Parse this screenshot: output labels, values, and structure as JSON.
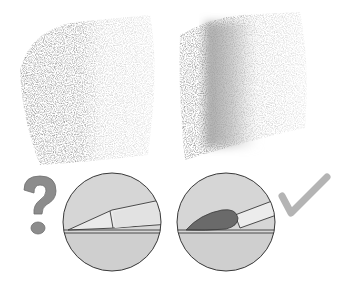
{
  "illustration": {
    "subject": "colored pencil blending comparison",
    "panels": [
      {
        "id": "left",
        "swatch": "pencil-only texture: dark grainy left half fading to light grainy right half",
        "tool": "pencil tip",
        "verdict": "question",
        "verdict_icon": "question-mark-icon"
      },
      {
        "id": "right",
        "swatch": "blended texture: grainy left edge, smooth blended middle band, light grainy right",
        "tool": "paint brush",
        "verdict": "correct",
        "verdict_icon": "checkmark-icon"
      }
    ],
    "colors": {
      "background": "#ffffff",
      "texture_dark": "#9a9a9a",
      "texture_light": "#d6d6d6",
      "circle_fill": "#d9d9d9",
      "circle_stroke": "#3a3a3a",
      "question_mark": "#8c8c8c",
      "checkmark": "#b4b4b4",
      "brush_tip": "#6a6a6a"
    }
  }
}
